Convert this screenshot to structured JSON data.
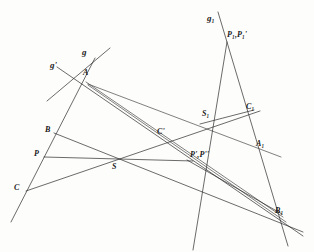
{
  "figure": {
    "type": "projective-geometry-construction",
    "background_color": "#fdfdfc",
    "stroke_color": "#2b2b2b",
    "width": 314,
    "height": 252
  },
  "line_labels": [
    {
      "id": "g",
      "text": "g",
      "x": 82,
      "y": 52
    },
    {
      "id": "g-prime",
      "text": "g'",
      "x": 52,
      "y": 64
    },
    {
      "id": "g-one",
      "text": "g₁",
      "x": 209,
      "y": 17
    }
  ],
  "point_labels": [
    {
      "id": "A",
      "text": "A",
      "x": 83,
      "y": 72
    },
    {
      "id": "B",
      "text": "B",
      "x": 47,
      "y": 129
    },
    {
      "id": "C",
      "text": "C",
      "x": 16,
      "y": 187
    },
    {
      "id": "P",
      "text": "P",
      "x": 36,
      "y": 152
    },
    {
      "id": "S",
      "text": "S",
      "x": 113,
      "y": 164
    },
    {
      "id": "C-prime",
      "text": "C'",
      "x": 158,
      "y": 130
    },
    {
      "id": "P-primes",
      "text": "P',P''",
      "x": 190,
      "y": 153
    },
    {
      "id": "P-one",
      "text": "P₁,P₁'",
      "x": 228,
      "y": 34
    },
    {
      "id": "S-one",
      "text": "S₁",
      "x": 203,
      "y": 112
    },
    {
      "id": "C-one",
      "text": "C₁",
      "x": 247,
      "y": 106
    },
    {
      "id": "A-one",
      "text": "A₁",
      "x": 257,
      "y": 142
    },
    {
      "id": "B-one",
      "text": "B₁",
      "x": 276,
      "y": 209
    }
  ],
  "lines": [
    {
      "id": "line-g",
      "name": "line-g",
      "x1": 110,
      "y1": 48,
      "x2": 48,
      "y2": 100
    },
    {
      "id": "line-g-prime",
      "name": "line-g-prime",
      "x1": 58,
      "y1": 68,
      "x2": 297,
      "y2": 233
    },
    {
      "id": "line-A-C",
      "name": "line-through-A-B-C",
      "x1": 93,
      "y1": 61,
      "x2": 13,
      "y2": 219
    },
    {
      "id": "line-A-A1",
      "name": "line-A-to-A1",
      "x1": 88,
      "y1": 84,
      "x2": 275,
      "y2": 155
    },
    {
      "id": "line-A-B1",
      "name": "line-A-to-B1",
      "x1": 88,
      "y1": 85,
      "x2": 281,
      "y2": 218
    },
    {
      "id": "line-C-S-C1",
      "name": "line-C-S-C1",
      "x1": 27,
      "y1": 190,
      "x2": 258,
      "y2": 112
    },
    {
      "id": "line-P-Pprime",
      "name": "line-P-to-Pprime",
      "x1": 45,
      "y1": 157,
      "x2": 192,
      "y2": 161
    },
    {
      "id": "line-B-S-B1",
      "name": "line-B-S-B1",
      "x1": 55,
      "y1": 134,
      "x2": 297,
      "y2": 230
    },
    {
      "id": "line-g1",
      "name": "line-g1-long",
      "x1": 219,
      "y1": 13,
      "x2": 286,
      "y2": 243
    },
    {
      "id": "line-P1-S1",
      "name": "line-P1-to-S1-extended",
      "x1": 226,
      "y1": 43,
      "x2": 194,
      "y2": 248
    },
    {
      "id": "line-S1-C1",
      "name": "line-S1-to-C1",
      "x1": 201,
      "y1": 123,
      "x2": 253,
      "y2": 111
    },
    {
      "id": "line-S-S1",
      "name": "line-S-through-S1",
      "x1": 86,
      "y1": 82,
      "x2": 280,
      "y2": 214
    },
    {
      "id": "line-Pprime-B1",
      "name": "line-Pprime-to-B1",
      "x1": 188,
      "y1": 161,
      "x2": 279,
      "y2": 212
    }
  ]
}
